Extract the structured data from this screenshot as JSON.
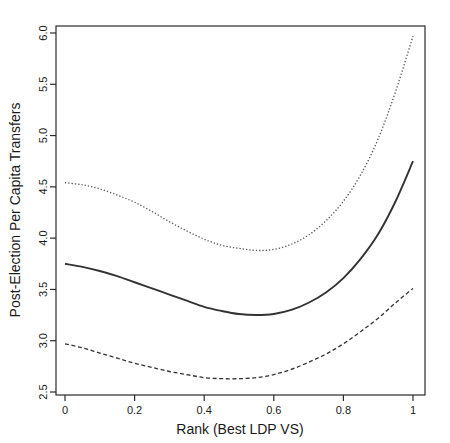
{
  "chart_data": {
    "type": "line",
    "title": "",
    "subtitle": "",
    "xlabel": "Rank (Best LDP VS)",
    "ylabel": "Post-Election Per Capita Transfers",
    "xlim": [
      0,
      1
    ],
    "ylim": [
      2.5,
      6.0
    ],
    "grid": false,
    "legend": "none",
    "xticks": [
      "0",
      "0.2",
      "0.4",
      "0.6",
      "0.8",
      "1"
    ],
    "xtick_values": [
      0,
      0.2,
      0.4,
      0.6,
      0.8,
      1
    ],
    "yticks": [
      "2.5",
      "3.0",
      "3.5",
      "4.0",
      "4.5",
      "5.0",
      "5.5",
      "6.0"
    ],
    "ytick_values": [
      2.5,
      3.0,
      3.5,
      4.0,
      4.5,
      5.0,
      5.5,
      6.0
    ],
    "x": [
      0,
      0.05,
      0.1,
      0.15,
      0.2,
      0.25,
      0.3,
      0.35,
      0.4,
      0.45,
      0.5,
      0.55,
      0.6,
      0.65,
      0.7,
      0.75,
      0.8,
      0.85,
      0.9,
      0.95,
      1
    ],
    "series": [
      {
        "name": "upper-confidence-band",
        "style": "dotted",
        "color": "#555555",
        "values": [
          4.54,
          4.52,
          4.48,
          4.42,
          4.35,
          4.26,
          4.16,
          4.07,
          3.99,
          3.93,
          3.9,
          3.88,
          3.89,
          3.94,
          4.03,
          4.17,
          4.36,
          4.62,
          4.97,
          5.43,
          5.97
        ]
      },
      {
        "name": "fitted-line",
        "style": "solid",
        "color": "#333333",
        "values": [
          3.75,
          3.72,
          3.68,
          3.63,
          3.57,
          3.51,
          3.45,
          3.39,
          3.33,
          3.29,
          3.26,
          3.25,
          3.26,
          3.3,
          3.37,
          3.47,
          3.61,
          3.8,
          4.04,
          4.36,
          4.75
        ]
      },
      {
        "name": "lower-confidence-band",
        "style": "dashed",
        "color": "#333333",
        "values": [
          2.97,
          2.93,
          2.88,
          2.83,
          2.78,
          2.74,
          2.7,
          2.67,
          2.64,
          2.63,
          2.63,
          2.64,
          2.67,
          2.72,
          2.79,
          2.87,
          2.97,
          3.09,
          3.22,
          3.37,
          3.51
        ]
      }
    ]
  },
  "axes": {
    "x_title": "Rank (Best LDP VS)",
    "y_title": "Post-Election Per Capita Transfers"
  }
}
